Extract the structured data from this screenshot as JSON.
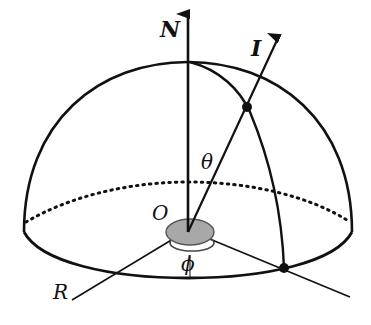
{
  "diagram": {
    "type": "hemisphere-coordinate-diagram",
    "labels": {
      "north_axis": "N",
      "vector": "I",
      "polar_angle": "θ",
      "azimuth_angle": "ϕ",
      "origin": "O",
      "reference_axis": "R"
    },
    "colors": {
      "line": "#111111",
      "origin_disk_fill": "#a8a8a8",
      "origin_disk_stroke": "#555555",
      "background": "#ffffff"
    }
  }
}
